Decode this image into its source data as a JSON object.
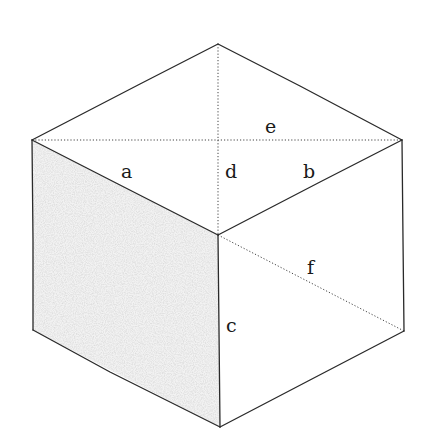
{
  "figure": {
    "type": "isometric-cube",
    "colors": {
      "background": "#ffffff",
      "edge": "#2a2a2a",
      "shaded_face": "#e4e4e4"
    },
    "vertices": {
      "top": [
        218,
        44
      ],
      "left_top": [
        32,
        140
      ],
      "right_top": [
        402,
        140
      ],
      "center": [
        218,
        235
      ],
      "left_bottom": [
        33,
        330
      ],
      "right_bottom": [
        404,
        331
      ],
      "bottom": [
        220,
        427
      ]
    },
    "labels": [
      {
        "id": "e",
        "text": "e",
        "x": 265,
        "y": 133
      },
      {
        "id": "a",
        "text": "a",
        "x": 121,
        "y": 178
      },
      {
        "id": "d",
        "text": "d",
        "x": 225,
        "y": 178
      },
      {
        "id": "b",
        "text": "b",
        "x": 303,
        "y": 178
      },
      {
        "id": "f",
        "text": "f",
        "x": 307,
        "y": 274
      },
      {
        "id": "c",
        "text": "c",
        "x": 226,
        "y": 332
      }
    ],
    "dotted_diagonals": [
      "e",
      "d",
      "f"
    ]
  }
}
